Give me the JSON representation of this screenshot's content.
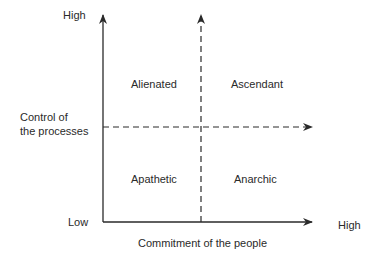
{
  "y_axis": {
    "label_line1": "Control of",
    "label_line2": "the processes",
    "high": "High",
    "low": "Low"
  },
  "x_axis": {
    "label": "Commitment of the people",
    "high": "High"
  },
  "quadrants": {
    "top_left": "Alienated",
    "top_right": "Ascendant",
    "bottom_left": "Apathetic",
    "bottom_right": "Anarchic"
  },
  "colors": {
    "line": "#2a2a2a",
    "text": "#2a2a2a"
  }
}
